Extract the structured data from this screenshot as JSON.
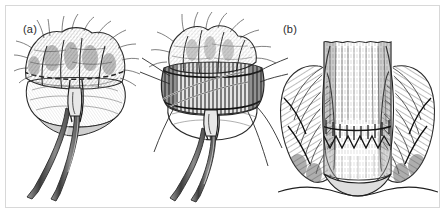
{
  "figure": {
    "kind": "medical-surgical-illustration",
    "style": "grayscale pen-and-ink line drawing",
    "background_color": "#ffffff",
    "frame_color": "#d8d8d8",
    "ink_color": "#2b2b2b",
    "width_px": 447,
    "height_px": 221,
    "panel_count": 3
  },
  "panels": [
    {
      "id": "a",
      "label": "(a)",
      "description": "Prolapsed hemorrhoidal / anorectal mucosal tissue mass grasped and retracted by a pair of long surgical forceps entering from below; irregular lobulated cushions at top with cross-hatched shading.",
      "instruments": "long forceps",
      "label_x": 13,
      "label_y": 17
    },
    {
      "id": "b",
      "label": "(b)",
      "description": "Same tissue mass after circumferential excision; a broad banded ring of dissected submucosa is visible, forceps hold the specimen while several suture threads radiate outward to the sides.",
      "instruments": "long forceps, suture threads",
      "label_x": 143,
      "label_y": 17
    },
    {
      "id": "c",
      "label": "(c)",
      "description": "Coronal cross-section of the anal canal after the resection, showing the completed circumferential staple/suture anastomosis line across the mid canal with the internal sphincter muscle bundles drawn on either side.",
      "instruments": "circular stapled anastomosis line",
      "label_x": 276,
      "label_y": 16
    }
  ],
  "colors": {
    "ink": "#2b2b2b",
    "mid_tone": "#8c8c8c",
    "light_tone": "#c9c9c9",
    "shadow_tone": "#5a5a5a",
    "frame": "#d8d8d8",
    "page": "#ffffff"
  }
}
